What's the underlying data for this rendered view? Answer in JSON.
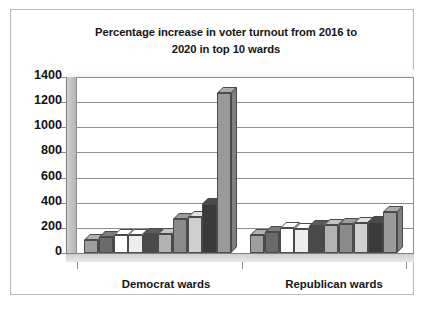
{
  "chart_data": {
    "type": "bar",
    "title": "Percentage increase in voter turnout from 2016 to 2020 in top 10 wards",
    "title_line1": "Percentage increase in voter turnout from 2016 to",
    "title_line2": "2020 in top 10 wards",
    "xlabel": "",
    "ylabel": "",
    "ylim": [
      0,
      1400
    ],
    "ytick_labels": [
      "1400",
      "1200",
      "1000",
      "800",
      "600",
      "400",
      "200",
      "0"
    ],
    "ytick_values": [
      1400,
      1200,
      1000,
      800,
      600,
      400,
      200,
      0
    ],
    "grid": true,
    "legend": "none",
    "categories": [
      "Democrat wards",
      "Republican wards"
    ],
    "groups": [
      {
        "name": "Democrat wards",
        "values": [
          105,
          125,
          140,
          145,
          150,
          150,
          270,
          290,
          390,
          1270
        ],
        "shades": [
          "#9e9e9e",
          "#6b6b6b",
          "#fefefe",
          "#eeeeee",
          "#4a4a4a",
          "#b2b2b2",
          "#8a8a8a",
          "#cfcfcf",
          "#3a3a3a",
          "#9a9a9a"
        ]
      },
      {
        "name": "Republican wards",
        "values": [
          140,
          165,
          195,
          190,
          215,
          220,
          230,
          240,
          250,
          330
        ],
        "shades": [
          "#9e9e9e",
          "#6b6b6b",
          "#fefefe",
          "#eeeeee",
          "#4a4a4a",
          "#b2b2b2",
          "#8a8a8a",
          "#cfcfcf",
          "#3a3a3a",
          "#9a9a9a"
        ]
      }
    ]
  }
}
